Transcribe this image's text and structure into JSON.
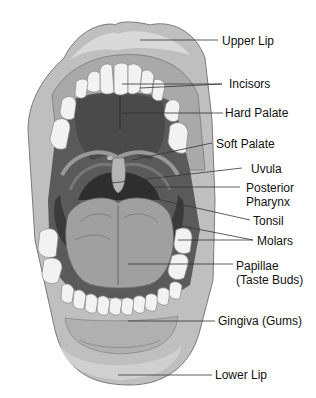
{
  "diagram": {
    "labels": [
      {
        "id": "upper-lip",
        "text": "Upper Lip",
        "x": 222,
        "y": 34
      },
      {
        "id": "incisors",
        "text": "Incisors",
        "x": 229,
        "y": 77
      },
      {
        "id": "hard-palate",
        "text": "Hard Palate",
        "x": 225,
        "y": 106
      },
      {
        "id": "soft-palate",
        "text": "Soft Palate",
        "x": 216,
        "y": 137
      },
      {
        "id": "uvula",
        "text": "Uvula",
        "x": 251,
        "y": 162
      },
      {
        "id": "posterior-pharynx",
        "text": "Posterior",
        "text2": "Pharynx",
        "x": 246,
        "y": 181
      },
      {
        "id": "tonsil",
        "text": "Tonsil",
        "x": 253,
        "y": 214
      },
      {
        "id": "molars",
        "text": "Molars",
        "x": 257,
        "y": 234
      },
      {
        "id": "papillae",
        "text": "Papillae",
        "text2": "(Taste Buds)",
        "x": 236,
        "y": 259
      },
      {
        "id": "gingiva",
        "text": "Gingiva (Gums)",
        "x": 218,
        "y": 314
      },
      {
        "id": "lower-lip",
        "text": "Lower Lip",
        "x": 215,
        "y": 368
      }
    ]
  }
}
